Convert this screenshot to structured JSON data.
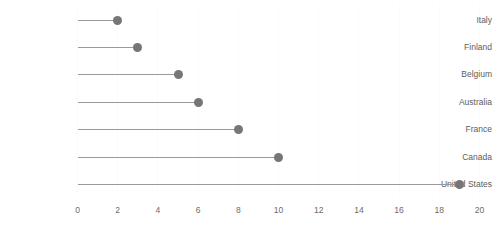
{
  "chart_data": {
    "type": "bar",
    "subtype": "lollipop-horizontal",
    "title": "",
    "subtitle": "",
    "xlabel": "",
    "ylabel": "",
    "categories": [
      "Italy",
      "Finland",
      "Belgium",
      "Australia",
      "France",
      "Canada",
      "United States"
    ],
    "values": [
      2,
      3,
      5,
      6,
      8,
      10,
      19
    ],
    "series": [
      {
        "name": "",
        "values": [
          2,
          3,
          5,
          6,
          8,
          10,
          19
        ]
      }
    ],
    "xlim": [
      0,
      20
    ],
    "ylim": null,
    "xticks": [
      0,
      2,
      4,
      6,
      8,
      10,
      12,
      14,
      16,
      18,
      20
    ],
    "xtick_labels": [
      "0",
      "2",
      "4",
      "6",
      "8",
      "10",
      "12",
      "14",
      "16",
      "18",
      "20"
    ],
    "grid": "vertical-faint",
    "legend": "none",
    "annotations": [],
    "colors": {
      "marker": "#767676",
      "stem": "#9a9a9a",
      "gridline": "#fbfbfb",
      "tick_text": "#6b6b6b",
      "category_text": "#5d5d5d",
      "background": "#ffffff"
    }
  }
}
